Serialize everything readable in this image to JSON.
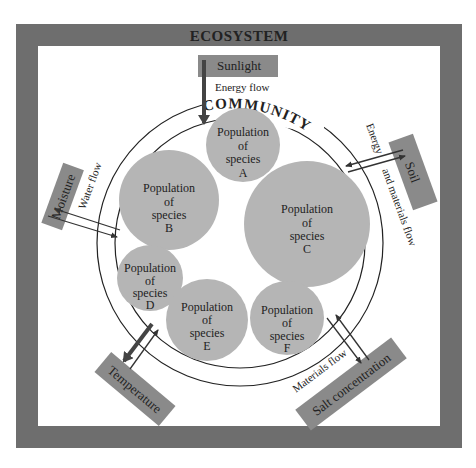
{
  "title": "ECOSYSTEM",
  "community_label": "COMMUNITY",
  "colors": {
    "frame": "#6e6e6e",
    "box": "#8a8a8a",
    "population": "#b5b5b5",
    "line": "#222222",
    "arrow_dark": "#555555"
  },
  "factors": {
    "sunlight": "Sunlight",
    "moisture": "Moisture",
    "soil": "Soil",
    "temperature": "Temperature",
    "salt": "Salt concentration"
  },
  "flows": {
    "energy": "Energy flow",
    "water": "Water flow",
    "energy_materials_1": "Energy",
    "energy_materials_2": "and materials flow",
    "materials": "Materials flow"
  },
  "populations": [
    {
      "l1": "Population",
      "l2": "of",
      "l3": "species",
      "id": "A"
    },
    {
      "l1": "Population",
      "l2": "of",
      "l3": "species",
      "id": "B"
    },
    {
      "l1": "Population",
      "l2": "of",
      "l3": "species",
      "id": "C"
    },
    {
      "l1": "Population",
      "l2": "of",
      "l3": "species",
      "id": "D"
    },
    {
      "l1": "Population",
      "l2": "of",
      "l3": "species",
      "id": "E"
    },
    {
      "l1": "Population",
      "l2": "of",
      "l3": "species",
      "id": "F"
    }
  ]
}
